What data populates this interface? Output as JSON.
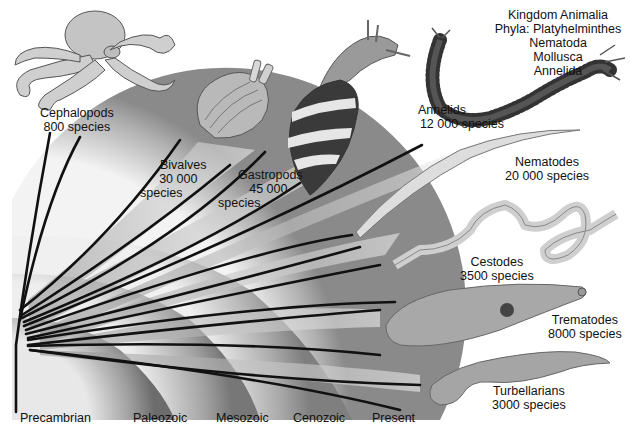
{
  "title": "Kingdom Animalia",
  "phyla_label": "Phyla: Platyhelminthes",
  "phyla": [
    "Platyhelminthes",
    "Nematoda",
    "Mollusca",
    "Annelida"
  ],
  "phyla_list_extra": [
    "Nematoda",
    "Mollusca",
    "Annelida"
  ],
  "eras": [
    "Precambrian",
    "Paleozoic",
    "Mesozoic",
    "Cenozoic",
    "Present"
  ],
  "groups": [
    {
      "name": "Cephalopods",
      "species": "800 species",
      "phylum": "Mollusca",
      "icon": "octopus-illustration"
    },
    {
      "name": "Bivalves",
      "species_line1": "30 000",
      "species_line2": "species",
      "phylum": "Mollusca",
      "icon": "clam-illustration"
    },
    {
      "name": "Gastropods",
      "species_line1": "45 000",
      "species_line2": "species",
      "phylum": "Mollusca",
      "icon": "snail-illustration"
    },
    {
      "name": "Annelids",
      "species": "12 000 species",
      "phylum": "Annelida",
      "icon": "segmented-worm-illustration"
    },
    {
      "name": "Nematodes",
      "species": "20 000 species",
      "phylum": "Nematoda",
      "icon": "roundworm-illustration"
    },
    {
      "name": "Cestodes",
      "species": "3500 species",
      "phylum": "Platyhelminthes",
      "icon": "tapeworm-illustration"
    },
    {
      "name": "Trematodes",
      "species": "8000 species",
      "phylum": "Platyhelminthes",
      "icon": "fluke-illustration"
    },
    {
      "name": "Turbellarians",
      "species": "3000 species",
      "phylum": "Platyhelminthes",
      "icon": "flatworm-illustration"
    }
  ],
  "colors": {
    "background": "#ffffff",
    "lines": "#111111",
    "arc_dark": "#6a6a6a",
    "arc_light": "#f2f2f2",
    "text": "#111111"
  }
}
